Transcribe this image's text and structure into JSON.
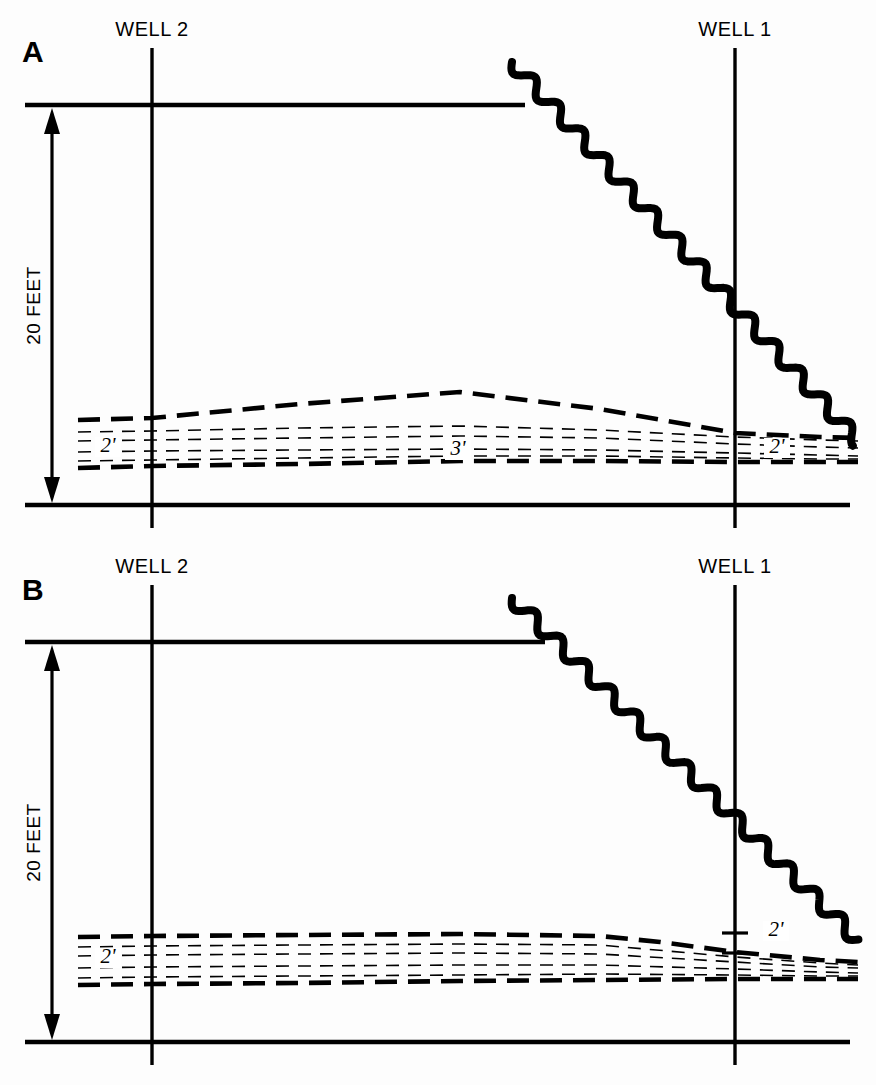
{
  "figure": {
    "caption": "",
    "background_color": "#fdfdfd",
    "ink_color": "#000000"
  },
  "panels": [
    {
      "id": "A",
      "letter": "A",
      "letter_x": 22,
      "letter_y": 62,
      "scale_label": "20 FEET",
      "wells": [
        {
          "name": "WELL 2",
          "label": "WELL 2",
          "x": 152,
          "label_x": 152,
          "label_y": 36,
          "top_y": 48,
          "bottom_y": 528
        },
        {
          "name": "WELL 1",
          "label": "WELL 1",
          "x": 735,
          "label_x": 735,
          "label_y": 36,
          "top_y": 48,
          "bottom_y": 528
        }
      ],
      "ground_surface": {
        "y": 105,
        "x_start": 25,
        "x_end": 525
      },
      "datum_line": {
        "y": 505,
        "x_start": 25,
        "x_end": 850
      },
      "scale_arrow": {
        "x": 52,
        "top_y": 108,
        "bottom_y": 503
      },
      "water_table": {
        "x_start": 512,
        "y_start": 62,
        "x_end": 858,
        "y_end": 441,
        "amplitude": 7,
        "wavelength": 36,
        "stroke_width": 8
      },
      "thickness_labels": [
        {
          "text": "2'",
          "x": 108,
          "y": 452
        },
        {
          "text": "3'",
          "x": 458,
          "y": 455
        },
        {
          "text": "2'",
          "x": 777,
          "y": 453
        }
      ],
      "layer_zone": {
        "top_boundary": [
          [
            78,
            420
          ],
          [
            152,
            418
          ],
          [
            300,
            404
          ],
          [
            460,
            392
          ],
          [
            600,
            409
          ],
          [
            735,
            433
          ],
          [
            820,
            437
          ],
          [
            858,
            438
          ]
        ],
        "bottom_boundary": [
          [
            78,
            468
          ],
          [
            152,
            466
          ],
          [
            300,
            464
          ],
          [
            460,
            461
          ],
          [
            600,
            461
          ],
          [
            735,
            462
          ],
          [
            820,
            462
          ],
          [
            858,
            462
          ]
        ],
        "inner_lines": [
          [
            [
              78,
              432
            ],
            [
              152,
              431
            ],
            [
              300,
              428
            ],
            [
              460,
              426
            ],
            [
              600,
              430
            ],
            [
              735,
              437
            ],
            [
              820,
              440
            ],
            [
              858,
              441
            ]
          ],
          [
            [
              78,
              441
            ],
            [
              152,
              440
            ],
            [
              300,
              438
            ],
            [
              460,
              436
            ],
            [
              600,
              438
            ],
            [
              735,
              444
            ],
            [
              820,
              447
            ],
            [
              858,
              448
            ]
          ],
          [
            [
              78,
              452
            ],
            [
              152,
              451
            ],
            [
              300,
              450
            ],
            [
              460,
              449
            ],
            [
              600,
              450
            ],
            [
              735,
              453
            ],
            [
              820,
              455
            ],
            [
              858,
              456
            ]
          ],
          [
            [
              78,
              461
            ],
            [
              152,
              460
            ],
            [
              300,
              458
            ],
            [
              460,
              456
            ],
            [
              600,
              456
            ],
            [
              735,
              458
            ],
            [
              820,
              459
            ],
            [
              858,
              459
            ]
          ]
        ]
      },
      "well_ticks": []
    },
    {
      "id": "B",
      "letter": "B",
      "letter_x": 22,
      "letter_y": 600,
      "scale_label": "20 FEET",
      "wells": [
        {
          "name": "WELL 2",
          "label": "WELL 2",
          "x": 152,
          "label_x": 152,
          "label_y": 573,
          "top_y": 585,
          "bottom_y": 1065
        },
        {
          "name": "WELL 1",
          "label": "WELL 1",
          "x": 735,
          "label_x": 735,
          "label_y": 573,
          "top_y": 585,
          "bottom_y": 1065
        }
      ],
      "ground_surface": {
        "y": 642,
        "x_start": 25,
        "x_end": 545
      },
      "datum_line": {
        "y": 1042,
        "x_start": 25,
        "x_end": 850
      },
      "scale_arrow": {
        "x": 52,
        "top_y": 645,
        "bottom_y": 1040
      },
      "water_table": {
        "x_start": 512,
        "y_start": 598,
        "x_end": 858,
        "y_end": 940,
        "amplitude": 7,
        "wavelength": 36,
        "stroke_width": 8
      },
      "thickness_labels": [
        {
          "text": "2'",
          "x": 108,
          "y": 963
        },
        {
          "text": "2'",
          "x": 776,
          "y": 936
        }
      ],
      "layer_zone": {
        "top_boundary": [
          [
            78,
            937
          ],
          [
            152,
            936
          ],
          [
            300,
            935
          ],
          [
            460,
            934
          ],
          [
            600,
            936
          ],
          [
            660,
            942
          ],
          [
            735,
            952
          ],
          [
            820,
            960
          ],
          [
            858,
            962
          ]
        ],
        "bottom_boundary": [
          [
            78,
            985
          ],
          [
            152,
            984
          ],
          [
            300,
            983
          ],
          [
            460,
            981
          ],
          [
            600,
            980
          ],
          [
            735,
            979
          ],
          [
            820,
            979
          ],
          [
            858,
            979
          ]
        ],
        "inner_lines": [
          [
            [
              78,
              947
            ],
            [
              152,
              946
            ],
            [
              300,
              945
            ],
            [
              460,
              944
            ],
            [
              600,
              945
            ],
            [
              735,
              957
            ],
            [
              820,
              963
            ],
            [
              858,
              965
            ]
          ],
          [
            [
              78,
              956
            ],
            [
              152,
              955
            ],
            [
              300,
              954
            ],
            [
              460,
              953
            ],
            [
              600,
              954
            ],
            [
              735,
              962
            ],
            [
              820,
              967
            ],
            [
              858,
              968
            ]
          ],
          [
            [
              78,
              968
            ],
            [
              152,
              967
            ],
            [
              300,
              966
            ],
            [
              460,
              965
            ],
            [
              600,
              965
            ],
            [
              735,
              969
            ],
            [
              820,
              972
            ],
            [
              858,
              973
            ]
          ],
          [
            [
              78,
              978
            ],
            [
              152,
              977
            ],
            [
              300,
              976
            ],
            [
              460,
              975
            ],
            [
              600,
              974
            ],
            [
              735,
              975
            ],
            [
              820,
              976
            ],
            [
              858,
              976
            ]
          ]
        ]
      },
      "well_ticks": [
        {
          "well": "WELL 1",
          "x": 735,
          "y": 933,
          "half_width": 13
        },
        {
          "well": "WELL 1",
          "x": 735,
          "y": 953,
          "half_width": 13
        }
      ]
    }
  ],
  "chart_data": {
    "type": "line",
    "xlabel": "",
    "ylabel": "Depth",
    "vertical_scale": "20 FEET",
    "annotations": [
      "A",
      "B",
      "WELL 2",
      "WELL 1",
      "20 FEET",
      "2'",
      "3'",
      "2'",
      "2'",
      "2'"
    ],
    "series": [
      {
        "name": "Panel A water table",
        "description": "wavy line sloping down from land surface left of Well 1 to below the unit at right edge"
      },
      {
        "name": "Panel A aquifer unit",
        "description": "dashed unit thickening to 3 feet mid-section, 2 feet at Well 2 and 2 feet at Well 1"
      },
      {
        "name": "Panel B water table",
        "description": "wavy line sloping down, crossing the unit right of Well 1"
      },
      {
        "name": "Panel B aquifer unit",
        "description": "dashed unit roughly 2 feet thick at Well 2 and 2 feet at Well 1"
      }
    ]
  }
}
